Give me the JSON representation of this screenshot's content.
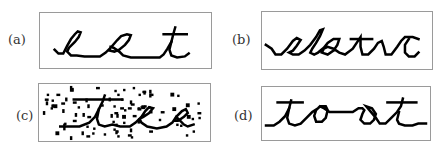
{
  "figure": {
    "panels": [
      {
        "id": "a",
        "label": "(a)",
        "word": "eat",
        "noise": false
      },
      {
        "id": "b",
        "label": "(b)",
        "word": "aleatc",
        "noise": false
      },
      {
        "id": "c",
        "label": "(c)",
        "word": "tea",
        "noise": true
      },
      {
        "id": "d",
        "label": "(d)",
        "word": "toat",
        "noise": false
      }
    ]
  },
  "colors": {
    "ink": "#000000",
    "border": "#9a9a9a",
    "label": "#333333",
    "background": "#ffffff"
  }
}
